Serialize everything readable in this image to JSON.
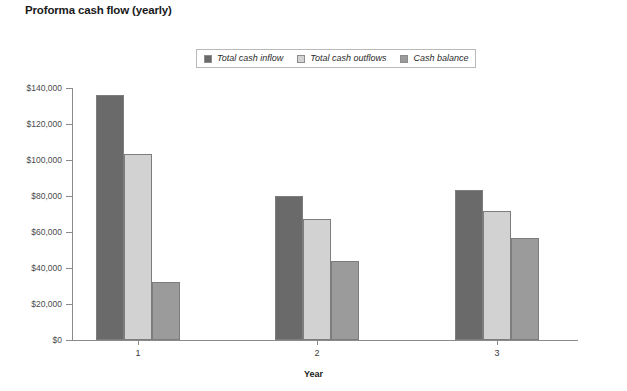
{
  "chart_data": {
    "type": "bar",
    "title": "Proforma cash flow (yearly)",
    "xlabel": "Year",
    "ylabel": "",
    "categories": [
      "1",
      "2",
      "3"
    ],
    "series": [
      {
        "name": "Total cash inflow",
        "values": [
          136000,
          80000,
          83500
        ],
        "color": "#6a6a6a"
      },
      {
        "name": "Total cash outflows",
        "values": [
          103500,
          67500,
          71500
        ],
        "color": "#d2d2d2"
      },
      {
        "name": "Cash balance",
        "values": [
          32500,
          44000,
          56500
        ],
        "color": "#9b9b9b"
      }
    ],
    "ylim": [
      0,
      140000
    ],
    "ytick_values": [
      0,
      20000,
      40000,
      60000,
      80000,
      100000,
      120000,
      140000
    ],
    "ytick_labels": [
      "$0",
      "$20,000",
      "$40,000",
      "$60,000",
      "$80,000",
      "$100,000",
      "$120,000",
      "$140,000"
    ],
    "grid": false,
    "legend_position": "top-center"
  }
}
